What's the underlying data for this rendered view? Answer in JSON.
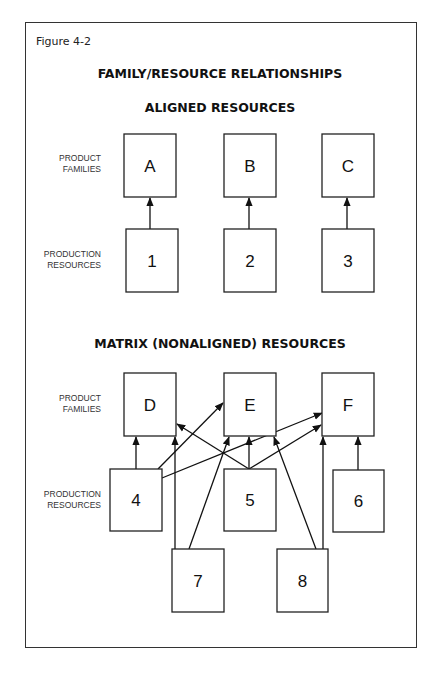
{
  "figure_label": "Figure 4-2",
  "title": "FAMILY/RESOURCE RELATIONSHIPS",
  "aligned": {
    "heading": "ALIGNED RESOURCES",
    "row_labels": {
      "families": [
        "PRODUCT",
        "FAMILIES"
      ],
      "resources": [
        "PRODUCTION",
        "RESOURCES"
      ]
    },
    "families": [
      {
        "id": "A",
        "x": 124,
        "y": 134,
        "w": 52,
        "h": 63
      },
      {
        "id": "B",
        "x": 224,
        "y": 134,
        "w": 52,
        "h": 63
      },
      {
        "id": "C",
        "x": 322,
        "y": 134,
        "w": 52,
        "h": 63
      }
    ],
    "resources": [
      {
        "id": "1",
        "x": 126,
        "y": 229,
        "w": 52,
        "h": 63
      },
      {
        "id": "2",
        "x": 224,
        "y": 229,
        "w": 52,
        "h": 63
      },
      {
        "id": "3",
        "x": 322,
        "y": 229,
        "w": 52,
        "h": 63
      }
    ],
    "links": [
      {
        "from": "1",
        "to": "A",
        "x1": 150,
        "y1": 229,
        "x2": 150,
        "y2": 198
      },
      {
        "from": "2",
        "to": "B",
        "x1": 249,
        "y1": 229,
        "x2": 249,
        "y2": 198
      },
      {
        "from": "3",
        "to": "C",
        "x1": 347,
        "y1": 229,
        "x2": 347,
        "y2": 198
      }
    ]
  },
  "matrix": {
    "heading": "MATRIX (NONALIGNED) RESOURCES",
    "row_labels": {
      "families": [
        "PRODUCT",
        "FAMILIES"
      ],
      "resources": [
        "PRODUCTION",
        "RESOURCES"
      ]
    },
    "families": [
      {
        "id": "D",
        "x": 124,
        "y": 373,
        "w": 52,
        "h": 63
      },
      {
        "id": "E",
        "x": 224,
        "y": 373,
        "w": 52,
        "h": 63
      },
      {
        "id": "F",
        "x": 322,
        "y": 373,
        "w": 52,
        "h": 63
      }
    ],
    "resources": [
      {
        "id": "4",
        "x": 110,
        "y": 469,
        "w": 52,
        "h": 62
      },
      {
        "id": "5",
        "x": 224,
        "y": 469,
        "w": 52,
        "h": 62
      },
      {
        "id": "6",
        "x": 333,
        "y": 470,
        "w": 51,
        "h": 62
      },
      {
        "id": "7",
        "x": 172,
        "y": 549,
        "w": 52,
        "h": 63
      },
      {
        "id": "8",
        "x": 277,
        "y": 549,
        "w": 51,
        "h": 63
      }
    ],
    "links": [
      {
        "from": "4",
        "to": "D",
        "x1": 136,
        "y1": 469,
        "x2": 136,
        "y2": 437
      },
      {
        "from": "4",
        "to": "E",
        "x1": 158,
        "y1": 469,
        "x2": 223,
        "y2": 403
      },
      {
        "from": "4",
        "to": "F",
        "x1": 162,
        "y1": 478,
        "x2": 322,
        "y2": 413
      },
      {
        "from": "7",
        "to": "D",
        "x1": 175,
        "y1": 549,
        "x2": 175,
        "y2": 437
      },
      {
        "from": "7",
        "to": "E",
        "x1": 189,
        "y1": 549,
        "x2": 229,
        "y2": 437
      },
      {
        "from": "5",
        "to": "D",
        "x1": 249,
        "y1": 469,
        "x2": 177,
        "y2": 424
      },
      {
        "from": "5",
        "to": "E",
        "x1": 249,
        "y1": 469,
        "x2": 249,
        "y2": 437
      },
      {
        "from": "5",
        "to": "F",
        "x1": 249,
        "y1": 469,
        "x2": 321,
        "y2": 425
      },
      {
        "from": "8",
        "to": "E",
        "x1": 316,
        "y1": 549,
        "x2": 274,
        "y2": 437
      },
      {
        "from": "8",
        "to": "F",
        "x1": 323,
        "y1": 549,
        "x2": 323,
        "y2": 437
      },
      {
        "from": "6",
        "to": "F",
        "x1": 358,
        "y1": 470,
        "x2": 358,
        "y2": 437
      }
    ]
  }
}
